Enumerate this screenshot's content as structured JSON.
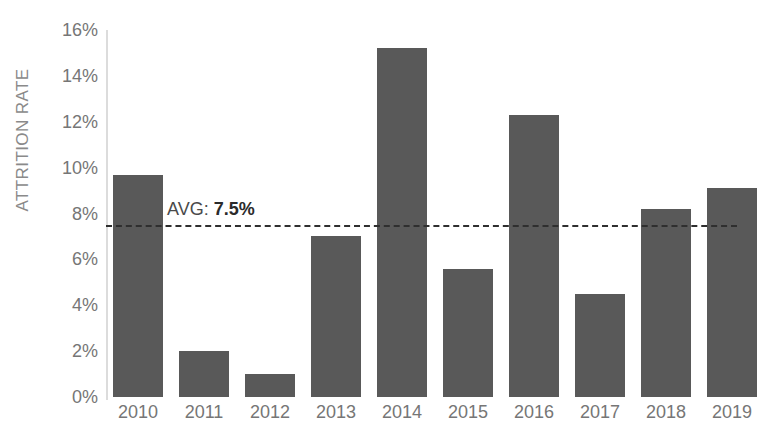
{
  "chart_data": {
    "type": "bar",
    "title": "Attrition rate over time",
    "xlabel": "",
    "ylabel": "ATTRITION RATE",
    "categories": [
      "2010",
      "2011",
      "2012",
      "2013",
      "2014",
      "2015",
      "2016",
      "2017",
      "2018",
      "2019"
    ],
    "values": [
      9.7,
      2.0,
      1.0,
      7.0,
      15.2,
      5.6,
      12.3,
      4.5,
      8.2,
      9.1
    ],
    "series": [
      {
        "name": "Attrition rate",
        "values": [
          9.7,
          2.0,
          1.0,
          7.0,
          15.2,
          5.6,
          12.3,
          4.5,
          8.2,
          9.1
        ]
      }
    ],
    "ylim": [
      0,
      16
    ],
    "ytick_step": 2,
    "ytick_labels": [
      "0%",
      "2%",
      "4%",
      "6%",
      "8%",
      "10%",
      "12%",
      "14%",
      "16%"
    ],
    "grid": false,
    "legend": "none",
    "bar_color": "#595959",
    "axis_color": "#dcdcdc",
    "tick_text_color": "#767676",
    "annotations": [
      {
        "type": "reference-line",
        "orientation": "horizontal",
        "value": 7.5,
        "style": "dashed",
        "color": "#2f2f2f",
        "label_prefix": "AVG: ",
        "label_value": "7.5%"
      }
    ]
  }
}
